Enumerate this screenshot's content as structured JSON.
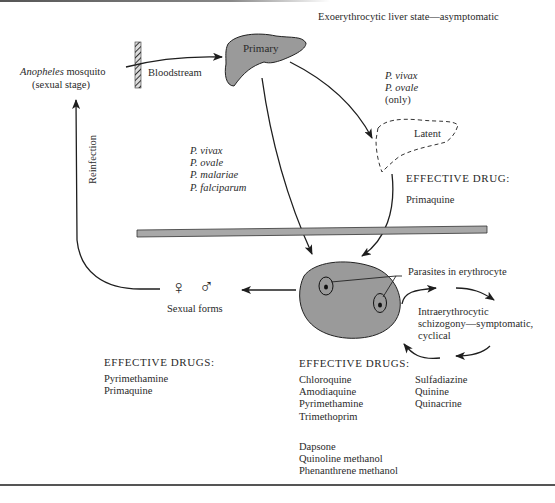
{
  "title": "Exoerythrocytic liver state—asymptomatic",
  "mosquito": {
    "name_italic": "Anopheles",
    "name_rest": " mosquito",
    "stage": "(sexual stage)"
  },
  "bloodstream_label": "Bloodstream",
  "reinfection_label": "Reinfection",
  "primary_liver_label": "Primary",
  "latent_liver_label": "Latent",
  "latent_species": [
    "P. vivax",
    "P. ovale"
  ],
  "latent_species_note": "(only)",
  "all_species": [
    "P. vivax",
    "P. ovale",
    "P. malariae",
    "P. falciparum"
  ],
  "liver_drug": {
    "heading": "EFFECTIVE DRUG:",
    "drugs": [
      "Primaquine"
    ]
  },
  "erythrocyte_label": "Parasites in erythrocyte",
  "cycle_label": [
    "Intraerythrocytic",
    "schizogony—symptomatic,",
    "cyclical"
  ],
  "sexual_forms": {
    "label": "Sexual forms",
    "female_symbol": "♀",
    "male_symbol": "♂"
  },
  "sexual_drugs": {
    "heading": "EFFECTIVE DRUGS:",
    "drugs": [
      "Pyrimethamine",
      "Primaquine"
    ]
  },
  "blood_drugs": {
    "heading": "EFFECTIVE DRUGS:",
    "group1": [
      "Chloroquine",
      "Amodiaquine",
      "Pyrimethamine",
      "Trimethoprim"
    ],
    "group2": [
      "Dapsone",
      "Quinoline methanol",
      "Phenanthrene methanol"
    ],
    "group3": [
      "Sulfadiazine",
      "Quinine",
      "Quinacrine"
    ]
  },
  "colors": {
    "organ_fill": "#9a9a9a",
    "barrier_fill": "#a8a8a8",
    "line": "#1e1e1e",
    "text": "#2a2a2a"
  }
}
